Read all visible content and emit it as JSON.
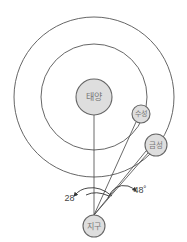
{
  "diagram": {
    "type": "orbital-elongation",
    "bodies": {
      "sun": {
        "label": "태양",
        "cx": 94,
        "cy": 97,
        "r": 18
      },
      "mercury": {
        "label": "수성",
        "cx": 141,
        "cy": 114,
        "r": 9
      },
      "venus": {
        "label": "금성",
        "cx": 156,
        "cy": 145,
        "r": 11
      },
      "earth": {
        "label": "지구",
        "cx": 94,
        "cy": 226,
        "r": 11
      }
    },
    "orbits": {
      "inner": {
        "cx": 94,
        "cy": 97,
        "r": 53
      },
      "outer": {
        "cx": 94,
        "cy": 97,
        "r": 80
      }
    },
    "angles": {
      "mercury_elongation": "28˚",
      "venus_elongation": "48˚"
    },
    "colors": {
      "body_fill": "#dedede",
      "stroke": "#555555",
      "text": "#777777"
    }
  }
}
